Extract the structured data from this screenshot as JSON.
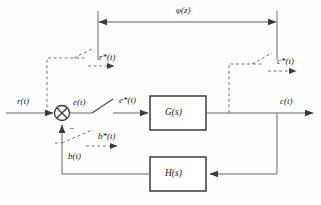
{
  "diagram": {
    "type": "control-block-diagram",
    "background_color": "#fefefe",
    "line_color": "#555555",
    "text_color": "#1c1c1c",
    "labels": {
      "phi": "φ(z)",
      "r_input": "r(t)",
      "r_star": "r*(t)",
      "e_signal": "e(t)",
      "e_star": "e*(t)",
      "b_signal": "b(t)",
      "b_star": "b*(t)",
      "c_output": "c(t)",
      "c_star": "c*(t)",
      "minus_sign": "−"
    },
    "blocks": [
      {
        "name": "forward-gain-block",
        "label": "G(s)",
        "x": 150,
        "y": 96,
        "w": 56,
        "h": 34
      },
      {
        "name": "feedback-block",
        "label": "H(s)",
        "x": 150,
        "y": 157,
        "w": 56,
        "h": 34
      }
    ],
    "summing_junction": {
      "name": "summing-junction",
      "symbol": "⊗",
      "cx": 62,
      "cy": 113,
      "r": 7.5,
      "inputs": [
        "r(t)",
        "b(t)"
      ],
      "output": "e(t)",
      "feedback_sign": "−"
    },
    "samplers": [
      {
        "name": "sampler-r",
        "output_label": "r*(t)"
      },
      {
        "name": "sampler-e",
        "output_label": "e*(t)"
      },
      {
        "name": "sampler-b",
        "output_label": "b*(t)"
      },
      {
        "name": "sampler-c",
        "output_label": "c*(t)"
      }
    ],
    "span_annotation": {
      "name": "phi-span-arrow",
      "label": "φ(z)",
      "from_x": 98,
      "to_x": 277,
      "y": 22
    }
  }
}
